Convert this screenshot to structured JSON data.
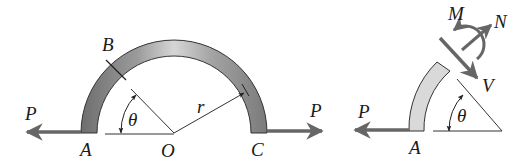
{
  "figure": {
    "left": {
      "labels": {
        "B": "B",
        "theta": "θ",
        "r": "r",
        "P_left": "P",
        "P_right": "P",
        "A": "A",
        "O": "O",
        "C": "C"
      },
      "description": "Semicircular curved bar of radius r with center O, loaded by horizontal forces P at ends A and C; section B at angle θ from horizontal"
    },
    "right": {
      "labels": {
        "M": "M",
        "N": "N",
        "V": "V",
        "P": "P",
        "theta": "θ",
        "A": "A"
      },
      "description": "Free-body diagram of segment AB with internal moment M, normal force N and shear force V at cut section"
    },
    "colors": {
      "bar_dark": "#6e6e6e",
      "bar_light": "#d8d8d8",
      "segment_fill": "#d9d9d9",
      "arrow": "#6a6a6a",
      "line": "#2a2a2a"
    }
  }
}
